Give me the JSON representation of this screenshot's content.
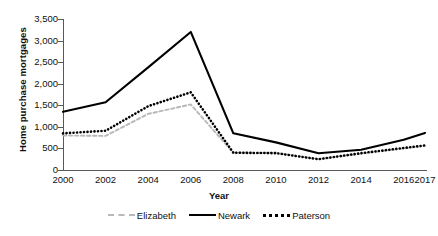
{
  "chart_data": {
    "type": "line",
    "title": "",
    "xlabel": "Year",
    "ylabel": "Home purchase mortgages",
    "categories": [
      "2000",
      "2002",
      "2004",
      "2006",
      "2008",
      "2010",
      "2012",
      "2014",
      "2016",
      "2017"
    ],
    "x": [
      2000,
      2002,
      2004,
      2006,
      2008,
      2010,
      2012,
      2014,
      2016,
      2017
    ],
    "ylim": [
      0,
      3500
    ],
    "yticks": [
      0,
      500,
      1000,
      1500,
      2000,
      2500,
      3000,
      3500
    ],
    "ytick_labels": [
      "0",
      "500",
      "1,000",
      "1,500",
      "2,000",
      "2,500",
      "3,000",
      "3,500"
    ],
    "grid": false,
    "legend_position": "bottom",
    "series": [
      {
        "name": "Elizabeth",
        "style": "dashed",
        "color": "#b8b8b8",
        "values": [
          800,
          790,
          1300,
          1520,
          400,
          400,
          250,
          380,
          500,
          560
        ]
      },
      {
        "name": "Newark",
        "style": "solid",
        "color": "#000000",
        "values": [
          1350,
          1570,
          2380,
          3200,
          850,
          640,
          390,
          470,
          700,
          860
        ]
      },
      {
        "name": "Paterson",
        "style": "dotted",
        "color": "#000000",
        "values": [
          850,
          910,
          1480,
          1800,
          400,
          390,
          250,
          390,
          510,
          570
        ]
      }
    ]
  },
  "axis": {
    "y_title": "Home purchase mortgages",
    "x_title": "Year",
    "y_labels": [
      "3,500",
      "3,000",
      "2,500",
      "2,000",
      "1,500",
      "1,000",
      "500",
      "0"
    ],
    "x_labels": [
      "2000",
      "2002",
      "2004",
      "2006",
      "2008",
      "2010",
      "2012",
      "2014",
      "2016",
      "2017"
    ]
  },
  "legend": {
    "items": [
      {
        "label": "Elizabeth"
      },
      {
        "label": "Newark"
      },
      {
        "label": "Paterson"
      }
    ]
  }
}
